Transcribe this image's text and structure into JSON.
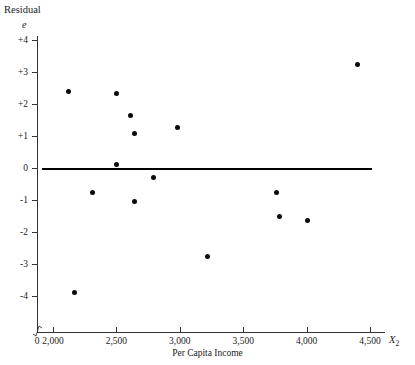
{
  "chart_data": {
    "type": "scatter",
    "title": "",
    "ylabel": "Residual",
    "y_symbol": "e",
    "xlabel": "Per Capita Income",
    "x_symbol": "X",
    "x_symbol_sub": "2",
    "xlim": [
      1700,
      4700
    ],
    "ylim": [
      -4.6,
      4.6
    ],
    "grid": false,
    "legend": null,
    "axis_break": true,
    "origin_label": "0",
    "reference_line": {
      "y": 0,
      "style": "solid",
      "color": "#000000"
    },
    "xticks": [
      2000,
      2500,
      3000,
      3500,
      4000,
      4500
    ],
    "xtick_labels": [
      "2,000",
      "2,500",
      "3,000",
      "3,500",
      "4,000",
      "4,500"
    ],
    "yticks": [
      4,
      3,
      2,
      1,
      0,
      -1,
      -2,
      -3,
      -4
    ],
    "ytick_labels": [
      "+4",
      "+3",
      "+2",
      "+1",
      "0",
      "-1",
      "-2",
      "-3",
      "-4"
    ],
    "marker_color": "#0b0b0b",
    "points": [
      {
        "x": 2120,
        "y": 2.4
      },
      {
        "x": 2500,
        "y": 2.32
      },
      {
        "x": 2610,
        "y": 1.63
      },
      {
        "x": 2645,
        "y": 1.08
      },
      {
        "x": 2980,
        "y": 1.28
      },
      {
        "x": 2500,
        "y": 0.1
      },
      {
        "x": 2790,
        "y": -0.3
      },
      {
        "x": 2315,
        "y": -0.75
      },
      {
        "x": 2640,
        "y": -1.05
      },
      {
        "x": 3220,
        "y": -2.75
      },
      {
        "x": 2170,
        "y": -3.9
      },
      {
        "x": 3760,
        "y": -0.75
      },
      {
        "x": 3790,
        "y": -1.5
      },
      {
        "x": 4010,
        "y": -1.65
      },
      {
        "x": 4400,
        "y": 3.25
      }
    ]
  }
}
